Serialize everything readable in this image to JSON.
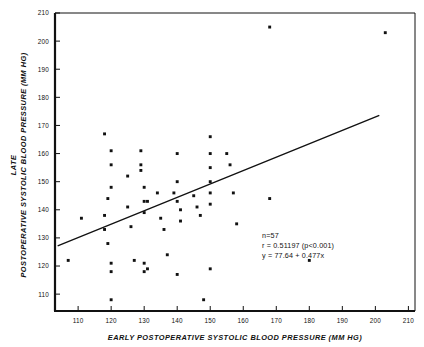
{
  "chart_data": {
    "type": "scatter",
    "title": "",
    "xlabel": "EARLY POSTOPERATIVE SYSTOLIC BLOOD PRESSURE (MM HG)",
    "ylabel_line1": "LATE",
    "ylabel_line2": "POSTOPERATIVE SYSTOLIC BLOOD PRESSURE (MM HG)",
    "xlim": [
      103,
      212
    ],
    "ylim": [
      104,
      210
    ],
    "xticks": [
      110,
      120,
      130,
      140,
      150,
      160,
      170,
      180,
      190,
      200,
      210
    ],
    "yticks": [
      110,
      120,
      130,
      140,
      150,
      160,
      170,
      180,
      190,
      200,
      210
    ],
    "xtick_labels": [
      "110",
      "120",
      "130",
      "140",
      "150",
      "160",
      "170",
      "180",
      "190",
      "200",
      "210"
    ],
    "ytick_labels": [
      "110",
      "120",
      "130",
      "140",
      "150",
      "160",
      "170",
      "180",
      "190",
      "200",
      "210"
    ],
    "grid": false,
    "legend": null,
    "marker": "filled-square",
    "points": [
      [
        107,
        122
      ],
      [
        111,
        137
      ],
      [
        118,
        167
      ],
      [
        120,
        161
      ],
      [
        120,
        156
      ],
      [
        120,
        148
      ],
      [
        119,
        144
      ],
      [
        118,
        138
      ],
      [
        118,
        133
      ],
      [
        119,
        128
      ],
      [
        120,
        121
      ],
      [
        120,
        118
      ],
      [
        120,
        108
      ],
      [
        125,
        152
      ],
      [
        125,
        141
      ],
      [
        126,
        134
      ],
      [
        127,
        122
      ],
      [
        129,
        161
      ],
      [
        129,
        156
      ],
      [
        129,
        154
      ],
      [
        130,
        148
      ],
      [
        130,
        143
      ],
      [
        131,
        143
      ],
      [
        130,
        139
      ],
      [
        130,
        121
      ],
      [
        131,
        119
      ],
      [
        130,
        118
      ],
      [
        134,
        146
      ],
      [
        135,
        137
      ],
      [
        136,
        133
      ],
      [
        137,
        124
      ],
      [
        140,
        160
      ],
      [
        140,
        150
      ],
      [
        139,
        146
      ],
      [
        140,
        143
      ],
      [
        141,
        140
      ],
      [
        141,
        136
      ],
      [
        140,
        117
      ],
      [
        145,
        145
      ],
      [
        146,
        141
      ],
      [
        147,
        138
      ],
      [
        148,
        108
      ],
      [
        150,
        166
      ],
      [
        150,
        160
      ],
      [
        150,
        155
      ],
      [
        150,
        150
      ],
      [
        150,
        146
      ],
      [
        150,
        142
      ],
      [
        150,
        119
      ],
      [
        155,
        160
      ],
      [
        156,
        156
      ],
      [
        157,
        146
      ],
      [
        158,
        135
      ],
      [
        168,
        205
      ],
      [
        168,
        144
      ],
      [
        180,
        122
      ],
      [
        203,
        203
      ]
    ],
    "regression": {
      "equation": "y = 77.64 + 0.477x",
      "intercept": 77.64,
      "slope": 0.477,
      "x_start": 104,
      "x_end": 201
    },
    "annotations": {
      "n": "n=57",
      "r": "r = 0.51197 (p<0.001)",
      "equation": "y = 77.64 + 0.477x"
    }
  }
}
